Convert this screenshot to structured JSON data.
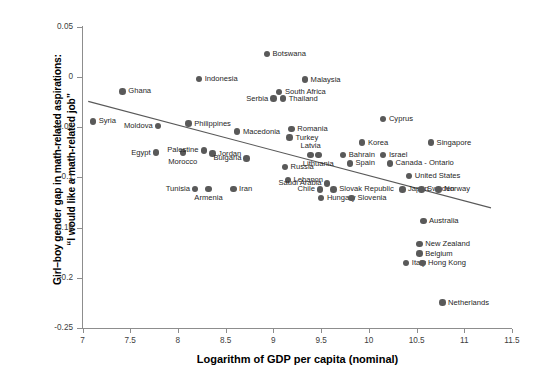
{
  "chart_data": {
    "type": "scatter",
    "title": "",
    "xlabel": "Logarithm of GDP per capita (nominal)",
    "ylabel": "Girl–boy gender gap in math-related aspirations: “I would like a math-related job”",
    "ylabel_lines": [
      "Girl–boy gender gap in math-related aspirations:",
      "“I would like a math-related job”"
    ],
    "xlim": [
      7,
      11.5
    ],
    "ylim": [
      -0.25,
      0.05
    ],
    "xticks": [
      "7",
      "7.5",
      "8",
      "8.5",
      "9",
      "9.5",
      "10",
      "10.5",
      "11",
      "11.5"
    ],
    "xtick_values": [
      7,
      7.5,
      8,
      8.5,
      9,
      9.5,
      10,
      10.5,
      11,
      11.5
    ],
    "yticks": [
      "0.05",
      "0",
      "-0.05",
      "-0.1",
      "-0.15",
      "-0.2",
      "-0.25"
    ],
    "ytick_values": [
      0.05,
      0,
      -0.05,
      -0.1,
      -0.15,
      -0.2,
      -0.25
    ],
    "grid": false,
    "legend": "none",
    "point_color": "#595959",
    "trendline": {
      "visible": true,
      "color": "#595959",
      "x_start": 7.06,
      "y_start": -0.0245,
      "x_end": 11.28,
      "y_end": -0.1305
    },
    "points": [
      {
        "label": "Syria",
        "x": 7.11,
        "y": -0.0443,
        "label_pos": "right"
      },
      {
        "label": "Ghana",
        "x": 7.42,
        "y": -0.0145,
        "label_pos": "right"
      },
      {
        "label": "Moldova",
        "x": 7.79,
        "y": -0.0489,
        "label_pos": "left"
      },
      {
        "label": "Egypt",
        "x": 7.77,
        "y": -0.0755,
        "label_pos": "left"
      },
      {
        "label": "Morocco",
        "x": 8.05,
        "y": -0.0755,
        "label_pos": "below"
      },
      {
        "label": "Palestine",
        "x": 8.27,
        "y": -0.0732,
        "label_pos": "left"
      },
      {
        "label": "Philippines",
        "x": 8.11,
        "y": -0.0466,
        "label_pos": "right"
      },
      {
        "label": "Indonesia",
        "x": 8.22,
        "y": -0.0024,
        "label_pos": "right"
      },
      {
        "label": "Jordan",
        "x": 8.36,
        "y": -0.0765,
        "label_pos": "right"
      },
      {
        "label": "Tunisia",
        "x": 8.18,
        "y": -0.1118,
        "label_pos": "left"
      },
      {
        "label": "Armenia",
        "x": 8.32,
        "y": -0.1118,
        "label_pos": "below"
      },
      {
        "label": "Iran",
        "x": 8.58,
        "y": -0.1118,
        "label_pos": "right"
      },
      {
        "label": "Macedonia",
        "x": 8.62,
        "y": -0.0546,
        "label_pos": "right"
      },
      {
        "label": "Bulgaria",
        "x": 8.72,
        "y": -0.0811,
        "label_pos": "left"
      },
      {
        "label": "Botswana",
        "x": 8.93,
        "y": 0.0227,
        "label_pos": "right"
      },
      {
        "label": "Serbia",
        "x": 9.0,
        "y": -0.0217,
        "label_pos": "left"
      },
      {
        "label": "Thailand",
        "x": 9.1,
        "y": -0.0217,
        "label_pos": "right"
      },
      {
        "label": "South Africa",
        "x": 9.06,
        "y": -0.0151,
        "label_pos": "right"
      },
      {
        "label": "Russia",
        "x": 9.12,
        "y": -0.0899,
        "label_pos": "right"
      },
      {
        "label": "Lebanon",
        "x": 9.15,
        "y": -0.1029,
        "label_pos": "right"
      },
      {
        "label": "Romania",
        "x": 9.19,
        "y": -0.0519,
        "label_pos": "right"
      },
      {
        "label": "Turkey",
        "x": 9.17,
        "y": -0.0604,
        "label_pos": "right"
      },
      {
        "label": "Malaysia",
        "x": 9.33,
        "y": -0.0027,
        "label_pos": "right"
      },
      {
        "label": "Latvia",
        "x": 9.39,
        "y": -0.0777,
        "label_pos": "above"
      },
      {
        "label": "Lithuania",
        "x": 9.47,
        "y": -0.0777,
        "label_pos": "below"
      },
      {
        "label": "Chile",
        "x": 9.49,
        "y": -0.1119,
        "label_pos": "left"
      },
      {
        "label": "Saudi Arabia",
        "x": 9.56,
        "y": -0.1061,
        "label_pos": "left"
      },
      {
        "label": "Hungary",
        "x": 9.5,
        "y": -0.1206,
        "label_pos": "right"
      },
      {
        "label": "Slovak Republic",
        "x": 9.63,
        "y": -0.1119,
        "label_pos": "right"
      },
      {
        "label": "Slovenia",
        "x": 9.82,
        "y": -0.1206,
        "label_pos": "right"
      },
      {
        "label": "Bahrain",
        "x": 9.73,
        "y": -0.0777,
        "label_pos": "right"
      },
      {
        "label": "Spain",
        "x": 9.8,
        "y": -0.0861,
        "label_pos": "right"
      },
      {
        "label": "Korea",
        "x": 9.93,
        "y": -0.0655,
        "label_pos": "right"
      },
      {
        "label": "Cyprus",
        "x": 10.15,
        "y": -0.042,
        "label_pos": "right"
      },
      {
        "label": "Israel",
        "x": 10.15,
        "y": -0.0777,
        "label_pos": "right"
      },
      {
        "label": "Canada - Ontario",
        "x": 10.22,
        "y": -0.0861,
        "label_pos": "right"
      },
      {
        "label": "Japan",
        "x": 10.35,
        "y": -0.1119,
        "label_pos": "right"
      },
      {
        "label": "United States",
        "x": 10.42,
        "y": -0.0985,
        "label_pos": "right"
      },
      {
        "label": "Italy",
        "x": 10.39,
        "y": -0.1855,
        "label_pos": "right"
      },
      {
        "label": "Singapore",
        "x": 10.65,
        "y": -0.0655,
        "label_pos": "right"
      },
      {
        "label": "Sweden",
        "x": 10.55,
        "y": -0.1119,
        "label_pos": "right"
      },
      {
        "label": "Norway",
        "x": 10.73,
        "y": -0.1119,
        "label_pos": "right"
      },
      {
        "label": "Australia",
        "x": 10.57,
        "y": -0.1435,
        "label_pos": "right"
      },
      {
        "label": "New Zealand",
        "x": 10.53,
        "y": -0.1665,
        "label_pos": "right"
      },
      {
        "label": "Belgium",
        "x": 10.53,
        "y": -0.176,
        "label_pos": "right"
      },
      {
        "label": "Hong Kong",
        "x": 10.56,
        "y": -0.1855,
        "label_pos": "right"
      },
      {
        "label": "Netherlands",
        "x": 10.77,
        "y": -0.2246,
        "label_pos": "right"
      }
    ]
  }
}
